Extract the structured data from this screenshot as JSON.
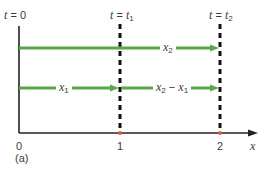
{
  "diagram": {
    "panel_label": "(a)",
    "axis": {
      "label": "x",
      "ticks": [
        "0",
        "1",
        "2"
      ]
    },
    "time_markers": [
      {
        "var": "t",
        "eq": " = ",
        "value": "0",
        "sub": ""
      },
      {
        "var": "t",
        "eq": " = ",
        "value": "t",
        "sub": "1"
      },
      {
        "var": "t",
        "eq": " = ",
        "value": "t",
        "sub": "2"
      }
    ],
    "arrows": [
      {
        "name": "x2",
        "var": "x",
        "sub": "2",
        "from": 0,
        "to": 2
      },
      {
        "name": "x1",
        "var": "x",
        "sub": "1",
        "from": 0,
        "to": 1
      },
      {
        "name": "x2-x1",
        "var_a": "x",
        "sub_a": "2",
        "op": " − ",
        "var_b": "x",
        "sub_b": "1",
        "from": 1,
        "to": 2
      }
    ],
    "colors": {
      "arrow": "#5aa64a",
      "axis": "#222222",
      "dashed": "#111111",
      "tick_mark": "#d9603b"
    }
  }
}
